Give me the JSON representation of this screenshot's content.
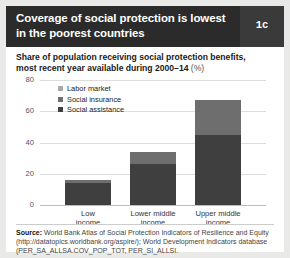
{
  "figure": {
    "number_badge": "1c",
    "title": "Coverage of social protection is lowest in the poorest countries",
    "subtitle_main": "Share of population receiving social protection benefits, most recent year available during 2000–14",
    "subtitle_unit": "(%)",
    "source_prefix": "Source:",
    "source_text": " World Bank Atlas of Social Protection Indicators of Resilience and Equity (http://datatopics.worldbank.org/aspire/); World Development Indicators database (PER_SA_ALLSA.COV_POP_TOT, PER_SI_ALLSI."
  },
  "colors": {
    "header_bg": "#2b2b2b",
    "badge_bg": "#3a3a3a",
    "social_assistance": "#3f3f3f",
    "social_insurance": "#6e6e6e",
    "labor_market": "#a8a8a8",
    "gridline": "#dddddd",
    "page_bg": "#e9e9e7"
  },
  "chart_data": {
    "type": "bar",
    "stacked": true,
    "title": "Coverage of social protection is lowest in the poorest countries",
    "subtitle": "Share of population receiving social protection benefits, most recent year available during 2000–14 (%)",
    "xlabel": "",
    "ylabel": "",
    "ylim": [
      0,
      80
    ],
    "yticks": [
      0,
      20,
      40,
      60,
      80
    ],
    "ytick_labels": [
      "0",
      "20",
      "40",
      "60",
      "80"
    ],
    "grid": true,
    "legend_position": "top-left",
    "categories": [
      "Low income",
      "Lower middle income",
      "Upper middle income"
    ],
    "category_lines": [
      [
        "Low",
        "income"
      ],
      [
        "Lower middle",
        "income"
      ],
      [
        "Upper middle",
        "income"
      ]
    ],
    "series": [
      {
        "name": "Social assistance",
        "values": [
          14,
          26,
          45
        ]
      },
      {
        "name": "Social insurance",
        "values": [
          2,
          8,
          22
        ]
      },
      {
        "name": "Labor market",
        "values": [
          0,
          0,
          0
        ]
      }
    ],
    "totals": [
      16,
      34,
      67
    ]
  },
  "legend": {
    "items": [
      {
        "label": "Labor market",
        "color": "#a8a8a8"
      },
      {
        "label": "Social insurance",
        "color": "#6e6e6e"
      },
      {
        "label": "Social assistance",
        "color": "#3f3f3f"
      }
    ]
  }
}
